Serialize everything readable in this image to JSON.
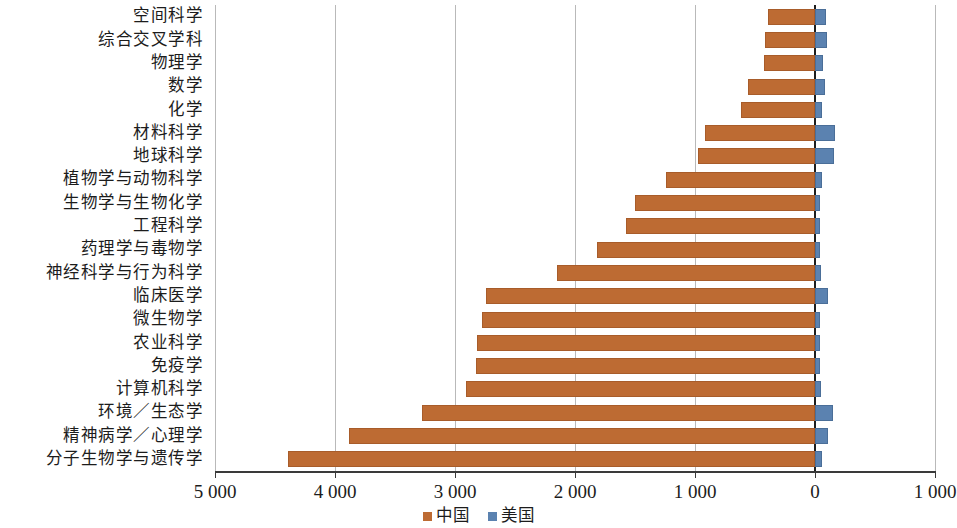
{
  "chart_data": {
    "type": "bar",
    "orientation": "horizontal",
    "title": "",
    "subtitle": "",
    "xlabel": "",
    "ylabel": "",
    "xlim": [
      5000,
      -1000
    ],
    "x_axis_reversed": true,
    "grid": true,
    "legend_position": "bottom-center",
    "xticks": [
      5000,
      4000,
      3000,
      2000,
      1000,
      0,
      1000
    ],
    "xticklabels": [
      "5 000",
      "4 000",
      "3 000",
      "2 000",
      "1 000",
      "0",
      "1 000"
    ],
    "categories": [
      "空间科学",
      "综合交叉学科",
      "物理学",
      "数学",
      "化学",
      "材料科学",
      "地球科学",
      "植物学与动物科学",
      "生物学与生物化学",
      "工程科学",
      "药理学与毒物学",
      "神经科学与行为科学",
      "临床医学",
      "微生物学",
      "农业科学",
      "免疫学",
      "计算机科学",
      "环境／生态学",
      "精神病学／心理学",
      "分子生物学与遗传学"
    ],
    "series": [
      {
        "name": "中国",
        "color": "#bd6b33",
        "direction": "left",
        "values": [
          390,
          417,
          425,
          560,
          618,
          919,
          973,
          1243,
          1498,
          1571,
          1815,
          2150,
          2741,
          2772,
          2818,
          2826,
          2907,
          3274,
          3880,
          4394
        ]
      },
      {
        "name": "美国",
        "color": "#5b82b0",
        "direction": "right",
        "values": [
          90,
          100,
          70,
          80,
          60,
          170,
          160,
          55,
          45,
          45,
          40,
          50,
          110,
          40,
          45,
          40,
          50,
          150,
          110,
          60
        ]
      }
    ]
  },
  "legend": {
    "items": [
      {
        "label": "中国",
        "color": "#bd6b33"
      },
      {
        "label": "美国",
        "color": "#5b82b0"
      }
    ]
  },
  "colors": {
    "china": "#bd6b33",
    "usa": "#5b82b0",
    "grid": "#b9b9b9",
    "axis": "#3a3a3a",
    "background": "#ffffff"
  }
}
